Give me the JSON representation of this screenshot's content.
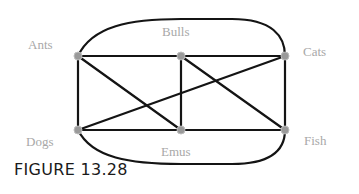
{
  "figure": {
    "caption": "FIGURE 13.28"
  },
  "graph": {
    "nodes": [
      {
        "id": "ants",
        "label": "Ants",
        "x": 78,
        "y": 56
      },
      {
        "id": "bulls",
        "label": "Bulls",
        "x": 181,
        "y": 56
      },
      {
        "id": "cats",
        "label": "Cats",
        "x": 285,
        "y": 56
      },
      {
        "id": "dogs",
        "label": "Dogs",
        "x": 78,
        "y": 130
      },
      {
        "id": "emus",
        "label": "Emus",
        "x": 181,
        "y": 130
      },
      {
        "id": "fish",
        "label": "Fish",
        "x": 285,
        "y": 130
      }
    ],
    "edges": [
      [
        "Ants",
        "Bulls"
      ],
      [
        "Bulls",
        "Cats"
      ],
      [
        "Dogs",
        "Emus"
      ],
      [
        "Emus",
        "Fish"
      ],
      [
        "Ants",
        "Dogs"
      ],
      [
        "Bulls",
        "Emus"
      ],
      [
        "Cats",
        "Fish"
      ],
      [
        "Ants",
        "Emus"
      ],
      [
        "Dogs",
        "Cats"
      ],
      [
        "Bulls",
        "Fish"
      ],
      [
        "Ants",
        "Cats"
      ],
      [
        "Dogs",
        "Fish"
      ]
    ],
    "colors": {
      "edge": "#141414",
      "node": "#9a9a9a",
      "label": "#a8a8a8"
    }
  }
}
